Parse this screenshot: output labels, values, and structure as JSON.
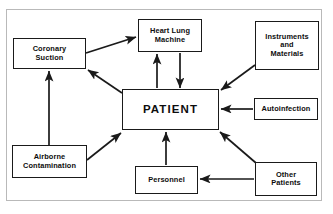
{
  "diagram": {
    "type": "flow-diagram",
    "background_color": "#ffffff",
    "line_color": "#1a1a1a",
    "frame_color": "#b9b9b9",
    "center_node": "PATIENT",
    "nodes": [
      {
        "id": "coronary-suction",
        "label": "Coronary\nSuction",
        "x": 13,
        "y": 38,
        "w": 73,
        "h": 31
      },
      {
        "id": "heart-lung-machine",
        "label": "Heart  Lung\nMachine",
        "x": 138,
        "y": 19,
        "w": 64,
        "h": 33
      },
      {
        "id": "instruments-and-materials",
        "label": "Instruments\nand\nMaterials",
        "x": 255,
        "y": 21,
        "w": 64,
        "h": 49
      },
      {
        "id": "patient",
        "label": "PATIENT",
        "x": 122,
        "y": 89,
        "w": 97,
        "h": 41
      },
      {
        "id": "autoinfection",
        "label": "Autoinfection",
        "x": 254,
        "y": 98,
        "w": 64,
        "h": 22
      },
      {
        "id": "airborne-contamination",
        "label": "Airborne\nContamination",
        "x": 12,
        "y": 145,
        "w": 75,
        "h": 33
      },
      {
        "id": "personnel",
        "label": "Personnel",
        "x": 135,
        "y": 166,
        "w": 63,
        "h": 28
      },
      {
        "id": "other-patients",
        "label": "Other\nPatients",
        "x": 255,
        "y": 162,
        "w": 62,
        "h": 34
      }
    ],
    "edges": [
      {
        "id": "coronary-suction-to-heart-lung-machine",
        "from": "coronary-suction",
        "to": "heart-lung-machine",
        "x1": 86,
        "y1": 53,
        "x2": 136,
        "y2": 37
      },
      {
        "id": "patient-to-coronary-suction",
        "from": "patient",
        "to": "coronary-suction",
        "x1": 122,
        "y1": 93,
        "x2": 88,
        "y2": 70
      },
      {
        "id": "patient-to-heart-lung-machine",
        "from": "patient",
        "to": "heart-lung-machine",
        "x1": 157,
        "y1": 88,
        "x2": 157,
        "y2": 54
      },
      {
        "id": "heart-lung-machine-to-patient",
        "from": "heart-lung-machine",
        "to": "patient",
        "x1": 180,
        "y1": 53,
        "x2": 180,
        "y2": 88
      },
      {
        "id": "instruments-and-materials-to-patient",
        "from": "instruments-and-materials",
        "to": "patient",
        "x1": 255,
        "y1": 65,
        "x2": 221,
        "y2": 90
      },
      {
        "id": "autoinfection-to-patient",
        "from": "autoinfection",
        "to": "patient",
        "x1": 253,
        "y1": 109,
        "x2": 221,
        "y2": 109
      },
      {
        "id": "airborne-contamination-to-coronary-suction",
        "from": "airborne-contamination",
        "to": "coronary-suction",
        "x1": 49,
        "y1": 145,
        "x2": 49,
        "y2": 71
      },
      {
        "id": "airborne-contamination-to-patient",
        "from": "airborne-contamination",
        "to": "patient",
        "x1": 87,
        "y1": 160,
        "x2": 121,
        "y2": 133
      },
      {
        "id": "personnel-to-patient",
        "from": "personnel",
        "to": "patient",
        "x1": 166,
        "y1": 165,
        "x2": 166,
        "y2": 132
      },
      {
        "id": "other-patients-to-patient",
        "from": "other-patients",
        "to": "patient",
        "x1": 256,
        "y1": 163,
        "x2": 220,
        "y2": 132
      },
      {
        "id": "other-patients-to-personnel",
        "from": "other-patients",
        "to": "personnel",
        "x1": 254,
        "y1": 179,
        "x2": 200,
        "y2": 179
      }
    ]
  }
}
